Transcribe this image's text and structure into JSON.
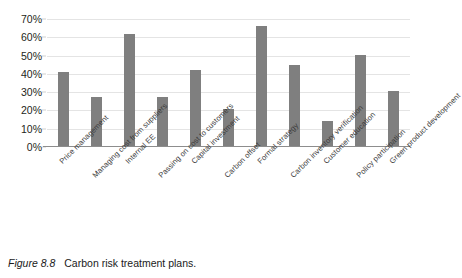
{
  "figure": {
    "number_label": "Figure 8.8",
    "caption_text": "Carbon risk treatment plans."
  },
  "chart_data": {
    "type": "bar",
    "title": "",
    "subtitle": "",
    "xlabel": "",
    "ylabel": "",
    "ylim": [
      0,
      70
    ],
    "ytick_labels": [
      "0%",
      "10%",
      "20%",
      "30%",
      "40%",
      "50%",
      "60%",
      "70%"
    ],
    "ytick_values": [
      0,
      10,
      20,
      30,
      40,
      50,
      60,
      70
    ],
    "y_unit": "%",
    "grid": true,
    "legend": false,
    "legend_position": "none",
    "bar_color": "#7f7f7f",
    "orientation": "vertical",
    "categories": [
      "Price management",
      "Managing cost from suppliers",
      "Internal EE",
      "Passing on cost to customers",
      "Capital investment",
      "Carbon offset",
      "Formal strategy",
      "Carbon inventory verification",
      "Customer education",
      "Policy participation",
      "Green product development"
    ],
    "values": [
      41,
      27.5,
      62,
      27.5,
      42,
      21,
      66,
      45,
      14,
      50.5,
      30.5
    ],
    "value_labels": [
      "41%",
      "27.5%",
      "62%",
      "27.5%",
      "42%",
      "21%",
      "66%",
      "45%",
      "14%",
      "50.5%",
      "30.5%"
    ]
  }
}
